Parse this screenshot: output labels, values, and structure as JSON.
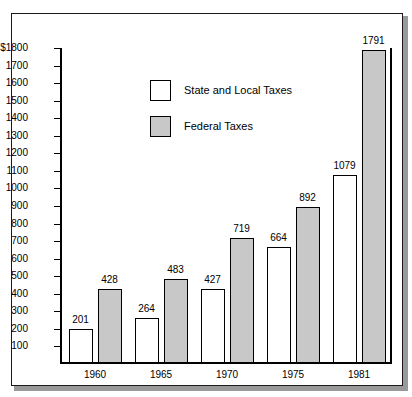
{
  "chart_data": {
    "type": "bar",
    "title": "",
    "xlabel": "",
    "ylabel": "",
    "categories": [
      "1960",
      "1965",
      "1970",
      "1975",
      "1981"
    ],
    "series": [
      {
        "name": "State and Local Taxes",
        "values": [
          201,
          264,
          427,
          664,
          1079
        ],
        "color": "#ffffff"
      },
      {
        "name": "Federal Taxes",
        "values": [
          428,
          483,
          719,
          892,
          1791
        ],
        "color": "#c8c8c8"
      }
    ],
    "ylim": [
      0,
      1800
    ],
    "y_tick_step": 100,
    "y_tick_labels": [
      "$1800",
      "1700",
      "1600",
      "1500",
      "1400",
      "1300",
      "1200",
      "1100",
      "1000",
      "900",
      "800",
      "700",
      "600",
      "500",
      "400",
      "300",
      "200",
      "100"
    ],
    "grid": false,
    "legend_position": "top-left-inside",
    "value_labels": true
  },
  "legend": {
    "items": [
      {
        "label": "State and Local Taxes",
        "swatch": "white-square"
      },
      {
        "label": "Federal Taxes",
        "swatch": "gray-square"
      }
    ]
  }
}
